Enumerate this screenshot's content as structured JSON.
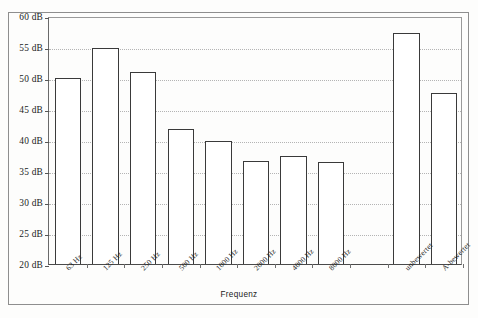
{
  "chart_data": {
    "type": "bar",
    "title": "",
    "xlabel": "Frequenz",
    "ylabel": "",
    "ylim": [
      20,
      60
    ],
    "ytick_step": 5,
    "ytick_labels": [
      "60 dB",
      "55 dB",
      "50 dB",
      "45 dB",
      "40 dB",
      "35 dB",
      "30 dB",
      "25 dB",
      "20 dB"
    ],
    "ytick_values": [
      60,
      55,
      50,
      45,
      40,
      35,
      30,
      25,
      20
    ],
    "grid": "horizontal-dotted",
    "legend": "none",
    "categories": [
      "63 Hz",
      "125 Hz",
      "250 Hz",
      "500 Hz",
      "1000 Hz",
      "2000 Hz",
      "4000 Hz",
      "8000 Hz",
      "",
      "unbewertet",
      "A-bewertet"
    ],
    "values": [
      50.0,
      54.9,
      50.9,
      41.8,
      39.8,
      36.6,
      37.4,
      36.5,
      null,
      57.3,
      47.6
    ],
    "bar_unit": "dB",
    "bar_fill": "#ffffff",
    "bar_edge": "#3a3a3a",
    "grid_color": "#b4b4b4",
    "axis_color": "#4a4a4a"
  }
}
